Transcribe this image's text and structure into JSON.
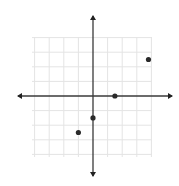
{
  "chart_data": {
    "type": "scatter",
    "title": "",
    "xlabel": "",
    "ylabel": "",
    "grid": true,
    "xlim": [
      -4,
      4
    ],
    "ylim": [
      -4,
      4
    ],
    "grid_step": 1,
    "axes_with_arrows": true,
    "points": [
      {
        "x": 1.5,
        "y": 0
      },
      {
        "x": 3.8,
        "y": 2.5
      },
      {
        "x": 0,
        "y": -1.5
      },
      {
        "x": -1,
        "y": -2.5
      }
    ]
  },
  "layout": {
    "origin_px": [
      93,
      96
    ],
    "unit_px": 14.6,
    "grid_px": {
      "left": 32,
      "right": 152,
      "top": 37,
      "bottom": 157
    },
    "x_axis_px": {
      "left": 18,
      "right": 172
    },
    "y_axis_px": {
      "top": 16,
      "bottom": 176
    }
  },
  "colors": {
    "grid": "#e4e4e4",
    "axis": "#3a3a3a",
    "point": "#2a2a2a"
  }
}
